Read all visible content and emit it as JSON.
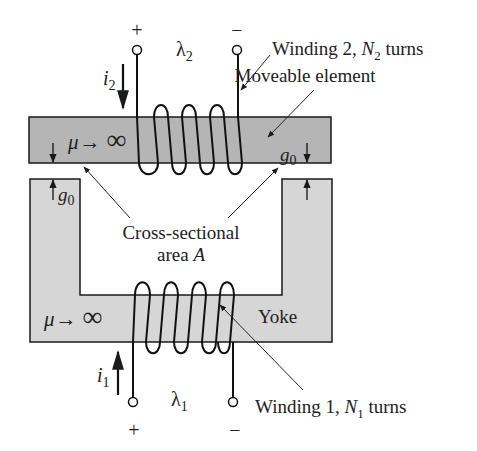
{
  "diagram": {
    "type": "magnetic-circuit",
    "colors": {
      "moveable_fill": "#b5b5b5",
      "yoke_fill": "#d6d6d6",
      "stroke": "#1a1a1a",
      "background": "#ffffff"
    },
    "top_winding": {
      "plus": "+",
      "minus": "−",
      "flux_symbol": "λ",
      "flux_sub": "2",
      "current_symbol": "i",
      "current_sub": "2",
      "label_prefix": "Winding 2, ",
      "label_N": "N",
      "label_N_sub": "2",
      "label_suffix": " turns"
    },
    "moveable": {
      "label": "Moveable element",
      "mu": "μ",
      "arrow": "→",
      "inf": "∞"
    },
    "gaps": {
      "g": "g",
      "sub": "0"
    },
    "cross_section": {
      "line1": "Cross-sectional",
      "line2_prefix": "area ",
      "line2_A": "A"
    },
    "yoke": {
      "label": "Yoke",
      "mu": "μ",
      "arrow": "→",
      "inf": "∞"
    },
    "bottom_winding": {
      "plus": "+",
      "minus": "−",
      "flux_symbol": "λ",
      "flux_sub": "1",
      "current_symbol": "i",
      "current_sub": "1",
      "label_prefix": "Winding 1, ",
      "label_N": "N",
      "label_N_sub": "1",
      "label_suffix": " turns"
    }
  }
}
